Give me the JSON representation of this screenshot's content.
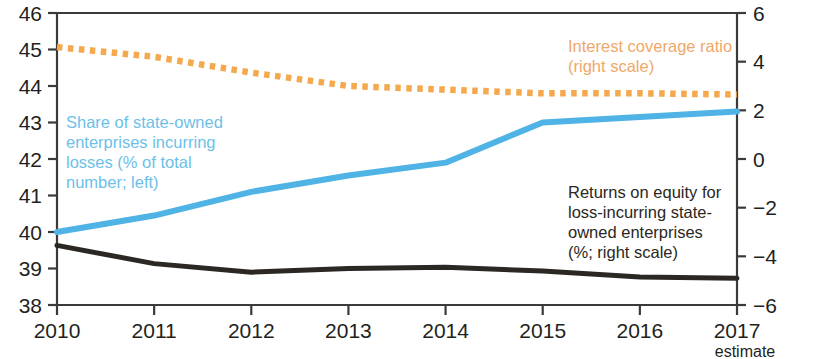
{
  "chart_data": {
    "type": "line",
    "title": "",
    "subtitle": "",
    "xlabel": "",
    "categories": [
      "2010",
      "2011",
      "2012",
      "2013",
      "2014",
      "2015",
      "2016",
      "2017"
    ],
    "x_sub_labels": [
      "",
      "",
      "",
      "",
      "",
      "",
      "",
      "estimate"
    ],
    "grid": false,
    "legend_position": "inline-annotations",
    "left_axis": {
      "label": "Share of state-owned enterprises incurring losses (% of total number)",
      "ticks": [
        "38",
        "39",
        "40",
        "41",
        "42",
        "43",
        "44",
        "45",
        "46"
      ],
      "ylim": [
        38,
        46
      ]
    },
    "right_axis": {
      "label": "Interest coverage ratio / Returns on equity (%)",
      "ticks": [
        "6",
        "4",
        "2",
        "0",
        "-2",
        "-4",
        "-6"
      ],
      "ylim": [
        -6,
        6
      ]
    },
    "series": [
      {
        "name": "Share of state-owned enterprises incurring losses (% of total number; left)",
        "axis": "left",
        "style": "solid",
        "color": "#4fb3e5",
        "values": [
          40.0,
          40.45,
          41.1,
          41.55,
          41.9,
          43.0,
          43.15,
          43.3
        ]
      },
      {
        "name": "Interest coverage ratio (right scale)",
        "axis": "right",
        "style": "dotted",
        "color": "#f5a94e",
        "values": [
          4.6,
          4.2,
          3.55,
          3.0,
          2.85,
          2.7,
          2.7,
          2.65
        ]
      },
      {
        "name": "Returns on equity for loss-incurring state-owned enterprises (%; right scale)",
        "axis": "right",
        "style": "solid",
        "color": "#2b2722",
        "values": [
          -3.55,
          -4.3,
          -4.65,
          -4.5,
          -4.45,
          -4.6,
          -4.85,
          -4.9
        ]
      }
    ],
    "annotations": [
      {
        "id": "blue",
        "text": "Share of state-owned\nenterprises incurring\nlosses (% of total\nnumber; left)",
        "color": "#6cbfe8"
      },
      {
        "id": "orange",
        "text": "Interest coverage ratio\n(right scale)",
        "color": "#f0a868"
      },
      {
        "id": "black",
        "text": "Returns on equity for\nloss-incurring state-\nowned enterprises\n(%; right scale)",
        "color": "#2b2722"
      }
    ]
  },
  "axes": {
    "left_ticks": [
      "46",
      "45",
      "44",
      "43",
      "42",
      "41",
      "40",
      "39",
      "38"
    ],
    "right_ticks": [
      "6",
      "4",
      "2",
      "0",
      "-2",
      "-4",
      "-6"
    ],
    "x_ticks": [
      "2010",
      "2011",
      "2012",
      "2013",
      "2014",
      "2015",
      "2016",
      "2017"
    ],
    "x_estimate_note": "estimate"
  },
  "colors": {
    "blue": "#4fb3e5",
    "orange": "#f5a94e",
    "black": "#2b2722",
    "axis": "#3c3a38"
  }
}
